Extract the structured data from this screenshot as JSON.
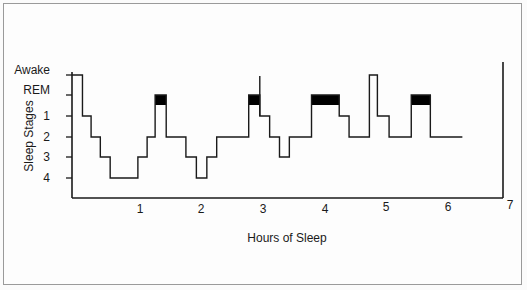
{
  "chart_data": {
    "type": "line",
    "subtype": "step (hypnogram)",
    "title": "",
    "xlabel": "Hours of Sleep",
    "ylabel": "Sleep Stages",
    "x_ticks": [
      "1",
      "2",
      "3",
      "4",
      "5",
      "6",
      "7"
    ],
    "y_ticks": [
      "Awake",
      "REM",
      "1",
      "2",
      "3",
      "4"
    ],
    "xlim": [
      0,
      7
    ],
    "grid": false,
    "legend": null,
    "series": [
      {
        "name": "Sleep stage",
        "segments": [
          {
            "start": 0.0,
            "end": 0.17,
            "stage": "Awake"
          },
          {
            "start": 0.17,
            "end": 0.31,
            "stage": "1"
          },
          {
            "start": 0.31,
            "end": 0.46,
            "stage": "2"
          },
          {
            "start": 0.46,
            "end": 0.62,
            "stage": "3"
          },
          {
            "start": 0.62,
            "end": 1.07,
            "stage": "4"
          },
          {
            "start": 1.07,
            "end": 1.22,
            "stage": "3"
          },
          {
            "start": 1.22,
            "end": 1.35,
            "stage": "2"
          },
          {
            "start": 1.35,
            "end": 1.53,
            "stage": "REM"
          },
          {
            "start": 1.53,
            "end": 1.85,
            "stage": "2"
          },
          {
            "start": 1.85,
            "end": 2.02,
            "stage": "3"
          },
          {
            "start": 2.02,
            "end": 2.19,
            "stage": "4"
          },
          {
            "start": 2.19,
            "end": 2.35,
            "stage": "3"
          },
          {
            "start": 2.35,
            "end": 2.87,
            "stage": "2"
          },
          {
            "start": 2.87,
            "end": 3.05,
            "stage": "REM"
          },
          {
            "start": 3.05,
            "end": 3.21,
            "stage": "1"
          },
          {
            "start": 3.21,
            "end": 3.37,
            "stage": "2"
          },
          {
            "start": 3.37,
            "end": 3.53,
            "stage": "3"
          },
          {
            "start": 3.53,
            "end": 3.89,
            "stage": "2"
          },
          {
            "start": 3.89,
            "end": 4.34,
            "stage": "REM"
          },
          {
            "start": 4.34,
            "end": 4.5,
            "stage": "1"
          },
          {
            "start": 4.5,
            "end": 4.83,
            "stage": "2"
          },
          {
            "start": 4.83,
            "end": 4.96,
            "stage": "Awake"
          },
          {
            "start": 4.96,
            "end": 5.15,
            "stage": "1"
          },
          {
            "start": 5.15,
            "end": 5.51,
            "stage": "2"
          },
          {
            "start": 5.51,
            "end": 5.82,
            "stage": "REM"
          },
          {
            "start": 5.82,
            "end": 6.34,
            "stage": "2"
          }
        ]
      }
    ],
    "annotations": [
      {
        "type": "rem-block",
        "start": 1.35,
        "end": 1.53
      },
      {
        "type": "rem-block",
        "start": 2.87,
        "end": 3.05
      },
      {
        "type": "rem-block",
        "start": 3.89,
        "end": 4.34
      },
      {
        "type": "rem-block",
        "start": 5.51,
        "end": 5.82
      },
      {
        "type": "vertical-spike",
        "x": 3.05,
        "note": "brief awakening line above REM"
      }
    ]
  },
  "labels": {
    "ylabel": "Sleep Stages",
    "xlabel": "Hours of Sleep",
    "y_ticks": [
      "Awake",
      "REM",
      "1",
      "2",
      "3",
      "4"
    ],
    "x_ticks": [
      "1",
      "2",
      "3",
      "4",
      "5",
      "6",
      "7"
    ]
  },
  "colors": {
    "line": "#1a1a1a",
    "rem_fill": "#000000",
    "frame": "#9a9a9a"
  }
}
